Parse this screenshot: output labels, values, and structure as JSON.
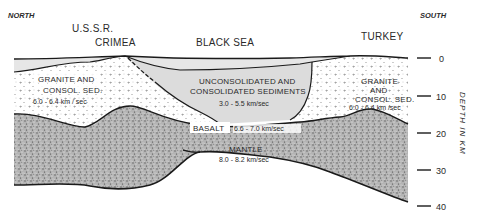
{
  "diagram": {
    "type": "geologic-cross-section",
    "directions": {
      "left": "NORTH",
      "right": "SOUTH"
    },
    "places": [
      {
        "id": "ussr",
        "label": "U.S.S.R."
      },
      {
        "id": "crimea",
        "label": "CRIMEA"
      },
      {
        "id": "black_sea",
        "label": "BLACK SEA"
      },
      {
        "id": "turkey",
        "label": "TURKEY"
      }
    ],
    "layers": {
      "granite_left": {
        "line1": "GRANITE  AND",
        "line2": "CONSOL. SED.",
        "speed": "6.0 - 6.4  km / sec"
      },
      "sediments": {
        "line1": "UNCONSOLIDATED  AND",
        "line2": "CONSOLIDATED  SEDIMENTS",
        "speed": "3.0 - 5.5  km/sec"
      },
      "granite_right": {
        "line1": "GRANITE",
        "line2": "AND",
        "line3": "CONSOL. SED.",
        "speed": "6.0  - 6.4  km /sec"
      },
      "basalt": {
        "label": "BASALT",
        "speed": "6.6 - 7.0  km/sec"
      },
      "mantle": {
        "label": "MANTLE",
        "speed": "8.0 - 8.2   km/sec"
      }
    },
    "depth_axis": {
      "title": "DEPTH  IN  KM",
      "ticks": [
        "0",
        "10",
        "20",
        "30",
        "40"
      ]
    },
    "colors": {
      "line": "#1a1a1a",
      "water": "#e6e6e6",
      "sediment": "#dcdcdc",
      "granite_bg": "#ffffff",
      "crust_stipple": "#9a9a9a"
    }
  }
}
